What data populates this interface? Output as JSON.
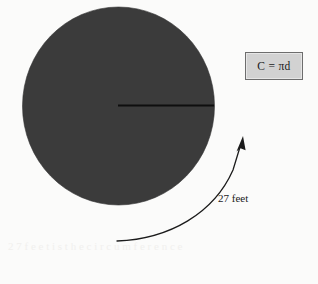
{
  "figure": {
    "title_alt": "Circle with radius line and curved arrow measurement",
    "background_color": "#fbfbfa",
    "shapes": {
      "circle": {
        "name": "shaded-circle",
        "fill_color": "#3a3a3a",
        "center_x": 118,
        "center_y": 106,
        "radius_x": 96,
        "radius_y": 99
      },
      "radius_line": {
        "name": "radius-line",
        "stroke_color": "#111111",
        "x1": 118,
        "y1": 105,
        "x2": 214,
        "y2": 105,
        "width": 2
      },
      "curved_arrow": {
        "name": "curved-measure-arrow",
        "stroke_color": "#1b1b1b",
        "start_x": 117,
        "start_y": 241,
        "end_x": 243,
        "end_y": 137,
        "arrowhead": "up-right"
      }
    }
  },
  "formula": {
    "text": "C = πd",
    "box_fill": "#d2d2d2",
    "box_border": "#6d6d6d"
  },
  "measurement": {
    "label": "27 feet",
    "value": 27,
    "unit": "feet"
  },
  "artifacts": {
    "bleed_text": "2 7   f e e t   i s   t h e   c i r c u m f e r e n c e"
  }
}
